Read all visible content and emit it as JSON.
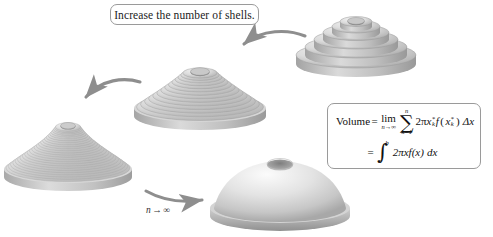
{
  "figure": {
    "width": 493,
    "height": 237,
    "background": "#ffffff"
  },
  "caption": {
    "text": "Increase the number of shells."
  },
  "formula": {
    "label_volume": "Volume",
    "equals": "=",
    "limit_operator": "lim",
    "limit_subscript": "n→∞",
    "sum_operator": "∑",
    "sum_upper": "n",
    "sum_lower": "k=1",
    "summand_coefficient": "2π",
    "summand_variable": "x",
    "summand_star": "*",
    "summand_index": "k",
    "summand_function": "f",
    "summand_delta": "Δx",
    "integral_operator": "∫",
    "integral_lower": "a",
    "integral_upper": "b",
    "integrand": "2πxf(x)",
    "integrand_differential": "dx",
    "line1_plain": "Volume = lim (n→∞) ∑ (k=1 to n) 2πxₖ* f(xₖ*) Δx",
    "line2_plain": "= ∫ (a to b) 2πx f(x) dx"
  },
  "arrows": [
    {
      "name": "arrow-top-to-middle",
      "label": ""
    },
    {
      "name": "arrow-middle-to-left",
      "label": ""
    },
    {
      "name": "arrow-left-to-limit",
      "label_variable": "n",
      "label_arrow": "→",
      "label_infinity": "∞"
    }
  ],
  "solids": [
    {
      "name": "solid-coarse-shells",
      "position": "top-right",
      "shell_count": 6,
      "smooth": false,
      "description": "Solid of revolution approximated by 6 coarse cylindrical shells"
    },
    {
      "name": "solid-medium-shells",
      "position": "middle-center",
      "shell_count": 14,
      "smooth": false,
      "description": "Solid of revolution approximated by 14 cylindrical shells"
    },
    {
      "name": "solid-fine-shells",
      "position": "left",
      "shell_count": 26,
      "smooth": false,
      "description": "Solid of revolution approximated by 26 thin cylindrical shells"
    },
    {
      "name": "solid-smooth-limit",
      "position": "bottom-center",
      "shell_count": 0,
      "smooth": true,
      "description": "Exact smooth solid of revolution, the limit as n approaches infinity"
    }
  ],
  "colors": {
    "background": "#ffffff",
    "solid_light": "#e9e9e9",
    "solid_mid": "#c9c9c9",
    "solid_dark": "#9e9e9e",
    "solid_shadow": "#8a8a8a",
    "arrow": "#8e8e8e",
    "box_border": "#9a9a9a",
    "text": "#111111"
  }
}
